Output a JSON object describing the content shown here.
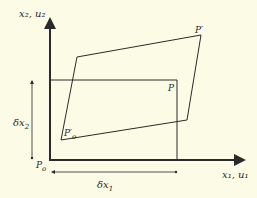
{
  "diagram": {
    "background": "#fbfbe6",
    "ink": "#2a2a2a",
    "axes": {
      "y_label": "x₂, u₂",
      "x_label": "x₁, u₁",
      "origin_label_main": "P",
      "origin_label_sub": "o"
    },
    "undeformed_rectangle": {
      "corner_label": "P"
    },
    "deformed_parallelogram": {
      "corner_label": "P′",
      "origin_label_main": "P′",
      "origin_label_sub": "o"
    },
    "dimensions": {
      "vertical_label_main": "δx",
      "vertical_label_sub": "2",
      "horizontal_label_main": "δx",
      "horizontal_label_sub": "1"
    }
  }
}
